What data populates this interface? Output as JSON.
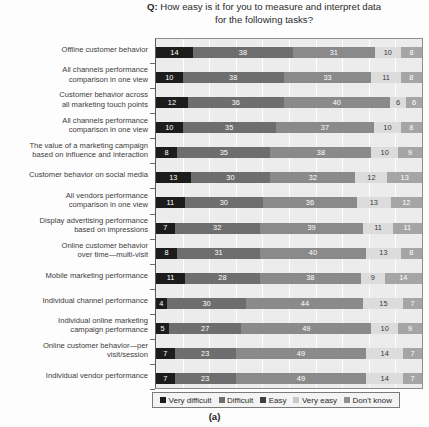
{
  "chart_data": {
    "type": "bar",
    "orientation": "horizontal",
    "stacked": true,
    "stacked_normalized": true,
    "title_prefix": "Q:",
    "title_line1": "Q: How easy is it for you to measure and interpret data",
    "title_line2": "for the following tasks?",
    "caption": "(a)",
    "xlabel": "",
    "ylabel": "",
    "xlim": [
      0,
      100
    ],
    "xtick_step": 10,
    "xticks_visible": false,
    "grid": true,
    "grid_axis": "x",
    "legend_position": "bottom",
    "legend": [
      "Very difficult",
      "Difficult",
      "Easy",
      "Very easy",
      "Don't know"
    ],
    "colors": [
      "#1c1c1c",
      "#6e6e6e",
      "#8a8a8a",
      "#dcdcdc",
      "#a5a5a5"
    ],
    "categories": [
      "Offline customer behavior",
      "All channels performance comparison in one view",
      "Customer behavior across all marketing touch points",
      "All channels performance comparison in one view",
      "The value of a marketing campaign based on influence and interaction",
      "Customer behavior on social media",
      "All vendors performance comparison in one view",
      "Display advertising performance based on impressions",
      "Online customer behavior over time—multi-visit",
      "Mobile marketing performance",
      "Individual channel performance",
      "Individual online marketing campaign performance",
      "Online customer behavior—per visit/session",
      "Individual vendor performance"
    ],
    "category_lines": [
      [
        "Offline customer behavior"
      ],
      [
        "All channels performance",
        "comparison in one view"
      ],
      [
        "Customer behavior across",
        "all marketing touch points"
      ],
      [
        "All channels performance",
        "comparison in one view"
      ],
      [
        "The value of a marketing campaign",
        "based on influence and interaction"
      ],
      [
        "Customer behavior on social media"
      ],
      [
        "All vendors performance",
        "comparison in one view"
      ],
      [
        "Display advertising performance",
        "based on impressions"
      ],
      [
        "Online customer behavior",
        "over time—multi-visit"
      ],
      [
        "Mobile marketing performance"
      ],
      [
        "Individual channel performance"
      ],
      [
        "Individual online marketing",
        "campaign performance"
      ],
      [
        "Online customer behavior—per",
        "visit/session"
      ],
      [
        "Individual vendor performance"
      ]
    ],
    "series": [
      {
        "name": "Very difficult",
        "values": [
          14,
          10,
          12,
          10,
          8,
          13,
          11,
          7,
          8,
          11,
          4,
          5,
          7,
          7
        ]
      },
      {
        "name": "Difficult",
        "values": [
          38,
          38,
          36,
          35,
          35,
          30,
          30,
          32,
          31,
          28,
          30,
          27,
          23,
          23
        ]
      },
      {
        "name": "Easy",
        "values": [
          31,
          33,
          40,
          37,
          38,
          32,
          36,
          39,
          40,
          38,
          44,
          49,
          49,
          49
        ]
      },
      {
        "name": "Very easy",
        "values": [
          10,
          11,
          6,
          10,
          10,
          12,
          13,
          11,
          13,
          9,
          15,
          10,
          14,
          14
        ]
      },
      {
        "name": "Don't know",
        "values": [
          8,
          8,
          6,
          8,
          9,
          13,
          12,
          11,
          8,
          14,
          7,
          9,
          7,
          7
        ]
      }
    ]
  }
}
